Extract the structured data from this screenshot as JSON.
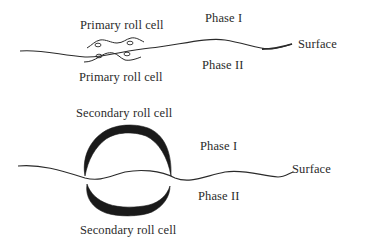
{
  "panels": [
    {
      "name": "primary",
      "top_label": "Primary roll cell",
      "bottom_label": "Primary roll cell",
      "phase_top": "Phase I",
      "phase_bottom": "Phase II",
      "surface_label": "Surface"
    },
    {
      "name": "secondary",
      "top_label": "Secondary roll cell",
      "bottom_label": "Secondary roll cell",
      "phase_top": "Phase I",
      "phase_bottom": "Phase II",
      "surface_label": "Surface"
    }
  ],
  "colors": {
    "line": "#2a2a2a",
    "fill": "#1a1a1a",
    "background": "#ffffff"
  }
}
